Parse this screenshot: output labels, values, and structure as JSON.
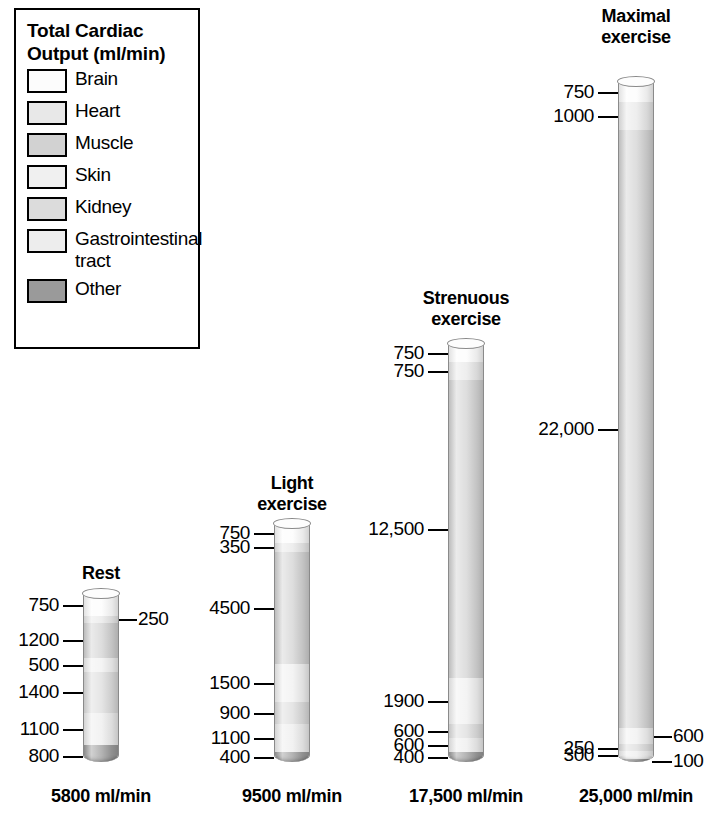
{
  "legend": {
    "title_line1": "Total Cardiac",
    "title_line2": "Output (ml/min)",
    "items": [
      {
        "label": "Brain",
        "label2": "",
        "color": "#fcfcfc"
      },
      {
        "label": "Heart",
        "label2": "",
        "color": "#e8e8e8"
      },
      {
        "label": "Muscle",
        "label2": "",
        "color": "#d2d2d2"
      },
      {
        "label": "Skin",
        "label2": "",
        "color": "#f0f0f0"
      },
      {
        "label": "Kidney",
        "label2": "",
        "color": "#dcdcdc"
      },
      {
        "label": "Gastrointestinal",
        "label2": "tract",
        "color": "#ededed"
      },
      {
        "label": "Other",
        "label2": "",
        "color": "#9a9a9a"
      }
    ]
  },
  "chart_data": {
    "type": "bar",
    "title": "Total Cardiac Output (ml/min)",
    "xlabel": "",
    "ylabel": "Cardiac output (ml/min)",
    "stacked": true,
    "orientation": "vertical",
    "grid": false,
    "legend_position": "top-left",
    "categories": [
      "Brain",
      "Heart",
      "Muscle",
      "Skin",
      "Kidney",
      "Gastrointestinal tract",
      "Other"
    ],
    "columns": [
      {
        "name": "Rest",
        "title_line1": "Rest",
        "title_line2": "",
        "total_label": "5800 ml/min",
        "total": 5800,
        "segments": [
          {
            "category": "Brain",
            "value": 750,
            "label": "750",
            "side": "left"
          },
          {
            "category": "Heart",
            "value": 250,
            "label": "250",
            "side": "right"
          },
          {
            "category": "Muscle",
            "value": 1200,
            "label": "1200",
            "side": "left"
          },
          {
            "category": "Skin",
            "value": 500,
            "label": "500",
            "side": "left"
          },
          {
            "category": "Kidney",
            "value": 1400,
            "label": "1400",
            "side": "left"
          },
          {
            "category": "Gastrointestinal tract",
            "value": 1100,
            "label": "1100",
            "side": "left"
          },
          {
            "category": "Other",
            "value": 800,
            "label": "800",
            "side": "left"
          }
        ]
      },
      {
        "name": "Light exercise",
        "title_line1": "Light",
        "title_line2": "exercise",
        "total_label": "9500 ml/min",
        "total": 9500,
        "segments": [
          {
            "category": "Brain",
            "value": 750,
            "label": "750",
            "side": "left"
          },
          {
            "category": "Heart",
            "value": 350,
            "label": "350",
            "side": "left"
          },
          {
            "category": "Muscle",
            "value": 4500,
            "label": "4500",
            "side": "left"
          },
          {
            "category": "Skin",
            "value": 1500,
            "label": "1500",
            "side": "left"
          },
          {
            "category": "Kidney",
            "value": 900,
            "label": "900",
            "side": "left"
          },
          {
            "category": "Gastrointestinal tract",
            "value": 1100,
            "label": "1100",
            "side": "left"
          },
          {
            "category": "Other",
            "value": 400,
            "label": "400",
            "side": "left"
          }
        ]
      },
      {
        "name": "Strenuous exercise",
        "title_line1": "Strenuous",
        "title_line2": "exercise",
        "total_label": "17,500 ml/min",
        "total": 17500,
        "segments": [
          {
            "category": "Brain",
            "value": 750,
            "label": "750",
            "side": "left"
          },
          {
            "category": "Heart",
            "value": 750,
            "label": "750",
            "side": "left"
          },
          {
            "category": "Muscle",
            "value": 12500,
            "label": "12,500",
            "side": "left"
          },
          {
            "category": "Skin",
            "value": 1900,
            "label": "1900",
            "side": "left"
          },
          {
            "category": "Kidney",
            "value": 600,
            "label": "600",
            "side": "left"
          },
          {
            "category": "Gastrointestinal tract",
            "value": 600,
            "label": "600",
            "side": "left"
          },
          {
            "category": "Other",
            "value": 400,
            "label": "400",
            "side": "left"
          }
        ]
      },
      {
        "name": "Maximal exercise",
        "title_line1": "Maximal",
        "title_line2": "exercise",
        "total_label": "25,000 ml/min",
        "total": 25000,
        "segments": [
          {
            "category": "Brain",
            "value": 750,
            "label": "750",
            "side": "left"
          },
          {
            "category": "Heart",
            "value": 1000,
            "label": "1000",
            "side": "left"
          },
          {
            "category": "Muscle",
            "value": 22000,
            "label": "22,000",
            "side": "left"
          },
          {
            "category": "Skin",
            "value": 600,
            "label": "600",
            "side": "right"
          },
          {
            "category": "Kidney",
            "value": 250,
            "label": "250",
            "side": "left"
          },
          {
            "category": "Gastrointestinal tract",
            "value": 300,
            "label": "300",
            "side": "left"
          },
          {
            "category": "Other",
            "value": 100,
            "label": "100",
            "side": "right"
          }
        ]
      }
    ]
  }
}
